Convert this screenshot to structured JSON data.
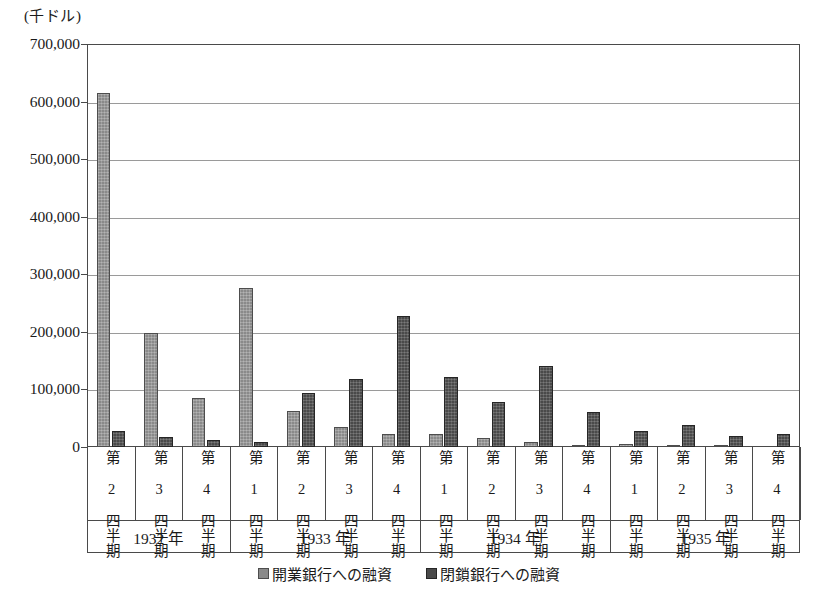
{
  "chart_data": {
    "type": "bar",
    "title": "",
    "unit_label": "(千ドル)",
    "xlabel": "",
    "ylabel": "",
    "ylim": [
      0,
      700000
    ],
    "ytick_values": [
      700000,
      600000,
      500000,
      400000,
      300000,
      200000,
      100000,
      0
    ],
    "ytick_labels": [
      "700,000",
      "600,000",
      "500,000",
      "400,000",
      "300,000",
      "200,000",
      "100,000",
      "0"
    ],
    "grid": true,
    "legend_position": "bottom-center",
    "legend": [
      "開業銀行への融資",
      "閉鎖銀行への融資"
    ],
    "colors": {
      "open_bank": "#8a8a8a",
      "closed_bank": "#4a4a4a",
      "axis": "#4a4a4a",
      "gridline": "#9a9a9a",
      "text": "#1a1a1a",
      "background": "#ffffff"
    },
    "year_groups": [
      {
        "label": "1932 年",
        "quarters": [
          "第 2 四半期",
          "第 3 四半期",
          "第 4 四半期"
        ]
      },
      {
        "label": "1933 年",
        "quarters": [
          "第 1 四半期",
          "第 2 四半期",
          "第 3 四半期",
          "第 4 四半期"
        ]
      },
      {
        "label": "1934 年",
        "quarters": [
          "第 1 四半期",
          "第 2 四半期",
          "第 3 四半期",
          "第 4 四半期"
        ]
      },
      {
        "label": "1935 年",
        "quarters": [
          "第 1 四半期",
          "第 2 四半期",
          "第 3 四半期",
          "第 4 四半期"
        ]
      }
    ],
    "categories": [
      "1932 第 2 四半期",
      "1932 第 3 四半期",
      "1932 第 4 四半期",
      "1933 第 1 四半期",
      "1933 第 2 四半期",
      "1933 第 3 四半期",
      "1933 第 4 四半期",
      "1934 第 1 四半期",
      "1934 第 2 四半期",
      "1934 第 3 四半期",
      "1934 第 4 四半期",
      "1935 第 1 四半期",
      "1935 第 2 四半期",
      "1935 第 3 四半期",
      "1935 第 4 四半期"
    ],
    "series": [
      {
        "name": "開業銀行への融資",
        "color": "#8a8a8a",
        "values": [
          615000,
          198000,
          85000,
          277000,
          63000,
          34000,
          22000,
          22000,
          16000,
          8000,
          4000,
          5000,
          2000,
          2000,
          0
        ]
      },
      {
        "name": "閉鎖銀行への融資",
        "color": "#4a4a4a",
        "values": [
          27000,
          17000,
          12000,
          9000,
          93000,
          119000,
          228000,
          122000,
          79000,
          141000,
          60000,
          28000,
          38000,
          19000,
          22000
        ]
      }
    ]
  }
}
